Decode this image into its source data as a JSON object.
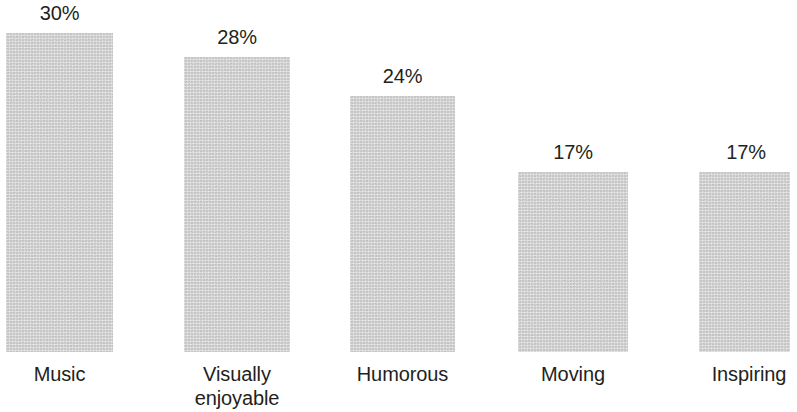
{
  "chart_data": {
    "type": "bar",
    "title": "",
    "subtitle": "",
    "xlabel": "",
    "ylabel": "",
    "grid": false,
    "legend": false,
    "axis_visible": false,
    "value_suffix": "%",
    "ylim": [
      0,
      30
    ],
    "categories": [
      "Music",
      "Visually enjoyable",
      "Humorous",
      "Moving",
      "Inspiring"
    ],
    "values": [
      30,
      28,
      24,
      17,
      17
    ],
    "value_labels": [
      "30%",
      "28%",
      "24%",
      "17%",
      "17%"
    ],
    "category_label_lines": [
      [
        "Music"
      ],
      [
        "Visually",
        "enjoyable"
      ],
      [
        "Humorous"
      ],
      [
        "Moving"
      ],
      [
        "Inspiring"
      ]
    ],
    "bar_color": "#d9d9d9",
    "text_color": "#231f20",
    "background_color": "#ffffff"
  },
  "bars": [
    {
      "name": "Music",
      "value_label": "30%",
      "category_label": "Music",
      "left": 6,
      "width": 107,
      "top": 33,
      "bottom": 352,
      "label_left": 6,
      "label_width": 107,
      "label_top": 3,
      "cat_left": -14,
      "cat_width": 147,
      "cat_top": 362
    },
    {
      "name": "Visually enjoyable",
      "value_label": "28%",
      "category_label": "Visually\nenjoyable",
      "left": 184,
      "width": 106,
      "top": 57,
      "bottom": 352,
      "label_left": 184,
      "label_width": 106,
      "label_top": 27,
      "cat_left": 164,
      "cat_width": 146,
      "cat_top": 362
    },
    {
      "name": "Humorous",
      "value_label": "24%",
      "category_label": "Humorous",
      "left": 350,
      "width": 105,
      "top": 96,
      "bottom": 352,
      "label_left": 350,
      "label_width": 105,
      "label_top": 66,
      "cat_left": 329,
      "cat_width": 147,
      "cat_top": 362
    },
    {
      "name": "Moving",
      "value_label": "17%",
      "category_label": "Moving",
      "left": 518,
      "width": 110,
      "top": 172,
      "bottom": 352,
      "label_left": 518,
      "label_width": 110,
      "label_top": 142,
      "cat_left": 498,
      "cat_width": 150,
      "cat_top": 362
    },
    {
      "name": "Inspiring",
      "value_label": "17%",
      "category_label": "Inspiring",
      "left": 699,
      "width": 91,
      "top": 172,
      "bottom": 352,
      "label_left": 694,
      "label_width": 104,
      "label_top": 142,
      "cat_left": 675,
      "cat_width": 148,
      "cat_top": 362
    }
  ]
}
